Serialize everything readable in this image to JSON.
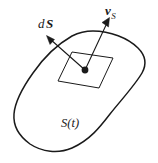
{
  "figure": {
    "background_color": "#ffffff",
    "stroke_color": "#1a1a1a",
    "labels": {
      "surface_element": {
        "text": "dS",
        "d": "d",
        "S": "S",
        "meaning": "differential surface element vector"
      },
      "surface_velocity": {
        "text": "vS",
        "v": "v",
        "subscript": "S",
        "meaning": "surface velocity vector"
      },
      "surface_region": {
        "text": "S(t)",
        "meaning": "time dependent surface"
      }
    },
    "elements": {
      "closed_curve_name": "blob-outline",
      "patch_name": "surface-patch-parallelogram",
      "point_name": "surface-point-dot",
      "normal_arrow_name": "dS-normal-arrow",
      "velocity_arrow_name": "vS-velocity-arrow"
    }
  }
}
